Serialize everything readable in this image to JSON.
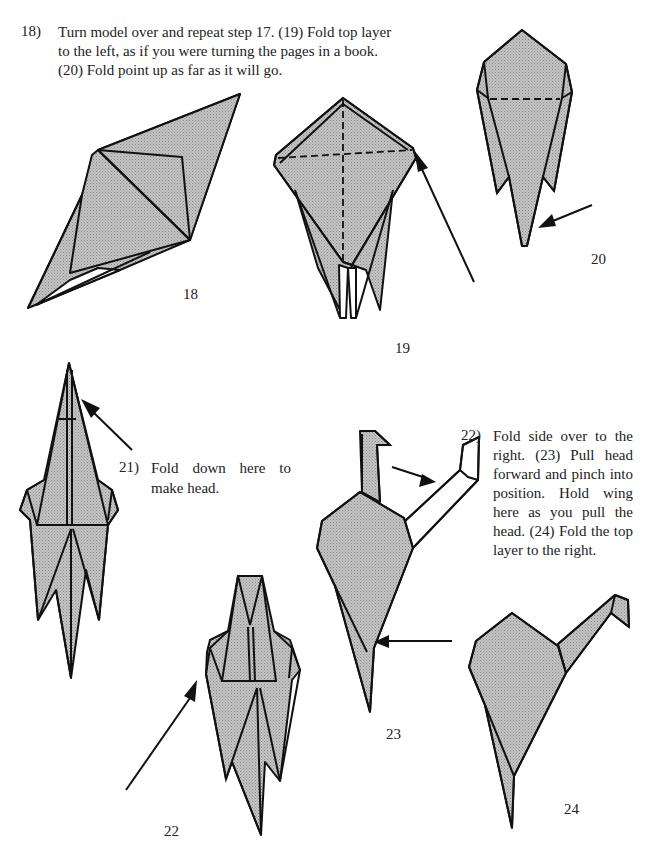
{
  "page": {
    "paper_color": "#b8b8b8",
    "line_color": "#111111"
  },
  "instructions": {
    "step18": {
      "number": "18)",
      "lines": [
        "Turn model over and repeat step 17. (19) Fold top layer",
        "to the left, as if you were turning the pages in a book.",
        "(20) Fold point up as far as it will go."
      ]
    },
    "step21": {
      "number": "21)",
      "lines": [
        "Fold down here to",
        "make head."
      ]
    },
    "step22": {
      "number": "22)",
      "lines": [
        "Fold side over to the",
        "right. (23) Pull head",
        "forward and pinch into",
        "position. Hold wing",
        "here as you pull the",
        "head. (24) Fold the top",
        "layer to the right."
      ]
    }
  },
  "diagram_labels": {
    "d18": "18",
    "d19": "19",
    "d20": "20",
    "d22": "22",
    "d23": "23",
    "d24": "24"
  }
}
